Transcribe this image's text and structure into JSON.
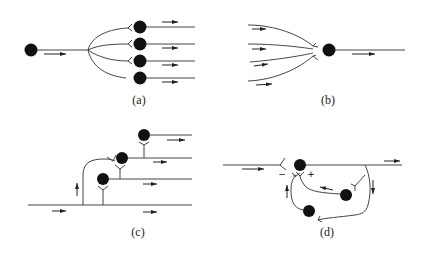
{
  "figure": {
    "panels": [
      {
        "id": "a",
        "label": "(a)",
        "name": "divergent circuit"
      },
      {
        "id": "b",
        "label": "(b)",
        "name": "convergent circuit"
      },
      {
        "id": "c",
        "label": "(c)",
        "name": "chain circuit"
      },
      {
        "id": "d",
        "label": "(d)",
        "name": "recurrent circuit"
      }
    ],
    "signs": {
      "plus": "+",
      "minus": "−"
    }
  }
}
